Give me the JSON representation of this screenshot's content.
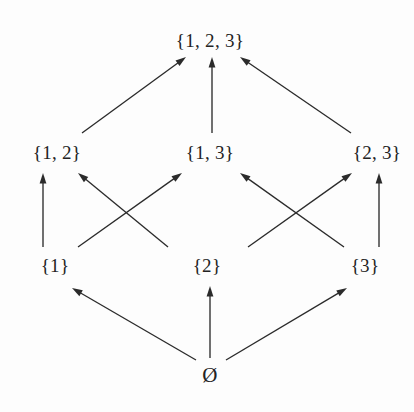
{
  "diagram": {
    "background_color": "#fdfdfd",
    "ink_color": "#2b2b2b",
    "text_color": "#232323",
    "nodes": [
      {
        "id": "full",
        "label": "{1, 2, 3}",
        "x": 210,
        "y": 40,
        "level": 3
      },
      {
        "id": "s12",
        "label": "{1, 2}",
        "x": 57,
        "y": 152,
        "level": 2
      },
      {
        "id": "s13",
        "label": "{1, 3}",
        "x": 210,
        "y": 152,
        "level": 2
      },
      {
        "id": "s23",
        "label": "{2, 3}",
        "x": 377,
        "y": 152,
        "level": 2
      },
      {
        "id": "s1",
        "label": "{1}",
        "x": 55,
        "y": 265,
        "level": 1
      },
      {
        "id": "s2",
        "label": "{2}",
        "x": 207,
        "y": 265,
        "level": 1
      },
      {
        "id": "s3",
        "label": "{3}",
        "x": 365,
        "y": 265,
        "level": 1
      },
      {
        "id": "empty",
        "label": "Ø",
        "x": 210,
        "y": 375,
        "level": 0
      }
    ],
    "edges": [
      {
        "from": "s12",
        "to": "full",
        "x1": 82,
        "y1": 133,
        "x2": 186,
        "y2": 57
      },
      {
        "from": "s13",
        "to": "full",
        "x1": 212,
        "y1": 133,
        "x2": 212,
        "y2": 57
      },
      {
        "from": "s23",
        "to": "full",
        "x1": 351,
        "y1": 133,
        "x2": 240,
        "y2": 57
      },
      {
        "from": "s1",
        "to": "s12",
        "x1": 43,
        "y1": 247,
        "x2": 43,
        "y2": 173
      },
      {
        "from": "s2",
        "to": "s12",
        "x1": 168,
        "y1": 247,
        "x2": 78,
        "y2": 173
      },
      {
        "from": "s1",
        "to": "s13",
        "x1": 78,
        "y1": 247,
        "x2": 182,
        "y2": 173
      },
      {
        "from": "s3",
        "to": "s13",
        "x1": 344,
        "y1": 247,
        "x2": 240,
        "y2": 173
      },
      {
        "from": "s2",
        "to": "s23",
        "x1": 248,
        "y1": 247,
        "x2": 352,
        "y2": 173
      },
      {
        "from": "s3",
        "to": "s23",
        "x1": 379,
        "y1": 247,
        "x2": 379,
        "y2": 173
      },
      {
        "from": "empty",
        "to": "s1",
        "x1": 196,
        "y1": 360,
        "x2": 72,
        "y2": 288
      },
      {
        "from": "empty",
        "to": "s2",
        "x1": 210,
        "y1": 358,
        "x2": 210,
        "y2": 286
      },
      {
        "from": "empty",
        "to": "s3",
        "x1": 226,
        "y1": 360,
        "x2": 347,
        "y2": 288
      }
    ]
  }
}
